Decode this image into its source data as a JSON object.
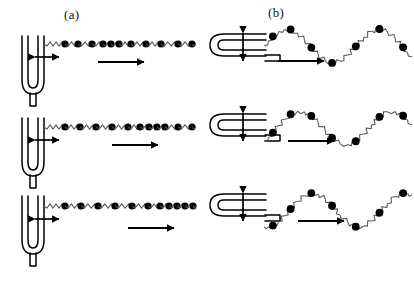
{
  "figure": {
    "title_a": "(a)",
    "title_b": "(b)",
    "background_color": "#ffffff",
    "ink_color": "#000000",
    "bead_color": "#000000",
    "spring_color": "#555555"
  },
  "panels": [
    {
      "id": "a",
      "label": "(a)",
      "wave_type": "longitudinal",
      "source_icon": "tuning-fork-icon",
      "source_orientation": "upright",
      "vibration_arrow": "double-arrow-horizontal-icon",
      "propagation_arrow": "arrow-right-icon",
      "rows": [
        {
          "index": 0,
          "fork_x": 22,
          "fork_y": 36,
          "chain_y": 44,
          "chain_x0": 62,
          "chain_x1": 196,
          "vib_arrow": {
            "x": 30,
            "y": 57,
            "len": 34
          },
          "prop_arrow": {
            "x": 98,
            "y": 62,
            "len": 52
          },
          "bead_positions": [
            65,
            78,
            92,
            103,
            111,
            119,
            131,
            146,
            161,
            178,
            192
          ]
        },
        {
          "index": 1,
          "fork_x": 22,
          "fork_y": 118,
          "chain_y": 127,
          "chain_x0": 62,
          "chain_x1": 196,
          "vib_arrow": {
            "x": 30,
            "y": 140,
            "len": 34
          },
          "prop_arrow": {
            "x": 112,
            "y": 145,
            "len": 52
          },
          "bead_positions": [
            65,
            80,
            96,
            112,
            128,
            140,
            149,
            157,
            165,
            178,
            192
          ]
        },
        {
          "index": 2,
          "fork_x": 22,
          "fork_y": 196,
          "chain_y": 206,
          "chain_x0": 62,
          "chain_x1": 196,
          "vib_arrow": {
            "x": 30,
            "y": 219,
            "len": 34
          },
          "prop_arrow": {
            "x": 128,
            "y": 228,
            "len": 52
          },
          "bead_positions": [
            65,
            81,
            98,
            115,
            132,
            148,
            160,
            169,
            177,
            185,
            193
          ]
        }
      ]
    },
    {
      "id": "b",
      "label": "(b)",
      "wave_type": "transverse",
      "source_icon": "tuning-fork-icon",
      "source_orientation": "rotated-right",
      "vibration_arrow": "double-arrow-vertical-icon",
      "propagation_arrow": "arrow-right-icon",
      "rows": [
        {
          "index": 0,
          "fork_x": 210,
          "fork_y": 34,
          "chain_x0": 264,
          "chain_x1": 412,
          "chain_y": 46,
          "amplitude": 17,
          "wavelength": 92,
          "phase": 0.0,
          "vib_arrow": {
            "x": 243,
            "y": 28,
            "len": 38
          },
          "prop_arrow": {
            "x": 278,
            "y": 61,
            "len": 52
          },
          "bead_phases": [
            0.06,
            0.18,
            0.32,
            0.46,
            0.62,
            0.78,
            0.94
          ]
        },
        {
          "index": 1,
          "fork_x": 210,
          "fork_y": 114,
          "chain_x0": 264,
          "chain_x1": 412,
          "chain_y": 128,
          "amplitude": 17,
          "wavelength": 92,
          "phase": 0.14,
          "vib_arrow": {
            "x": 243,
            "y": 108,
            "len": 38
          },
          "prop_arrow": {
            "x": 288,
            "y": 141,
            "len": 52
          },
          "bead_phases": [
            0.06,
            0.18,
            0.32,
            0.46,
            0.62,
            0.78,
            0.94
          ]
        },
        {
          "index": 2,
          "fork_x": 210,
          "fork_y": 194,
          "chain_x0": 264,
          "chain_x1": 412,
          "chain_y": 210,
          "amplitude": 17,
          "wavelength": 92,
          "phase": 0.28,
          "vib_arrow": {
            "x": 243,
            "y": 188,
            "len": 38
          },
          "prop_arrow": {
            "x": 298,
            "y": 221,
            "len": 52
          },
          "bead_phases": [
            0.06,
            0.18,
            0.32,
            0.46,
            0.62,
            0.78,
            0.94
          ]
        }
      ]
    }
  ]
}
